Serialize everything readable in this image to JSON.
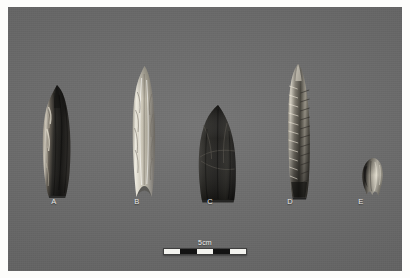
{
  "figure": {
    "background_color": "#6e6e6e",
    "border_color": "#fdfdfb",
    "caption_color": "#e8e8e6"
  },
  "specimens": [
    {
      "label": "A",
      "description": "dark mottled fluted projectile point, straight base",
      "color_dark": "#20201e",
      "color_mid": "#4a4843",
      "color_light": "#cfc9bc",
      "label_x": 54
    },
    {
      "label": "B",
      "description": "pale chalcedony fluted point with concave notched base",
      "color_dark": "#7d7a70",
      "color_mid": "#b8b4a6",
      "color_light": "#efece1",
      "label_x": 137
    },
    {
      "label": "C",
      "description": "broad dark lanceolate point, rounded tip",
      "color_dark": "#1b1a18",
      "color_mid": "#35332f",
      "color_light": "#5e5b54",
      "label_x": 210
    },
    {
      "label": "D",
      "description": "long narrow point with deeply serrated flaked edges",
      "color_dark": "#232220",
      "color_mid": "#5c5951",
      "color_light": "#d8d3c6",
      "label_x": 290
    },
    {
      "label": "E",
      "description": "small broken point fragment",
      "color_dark": "#2a2825",
      "color_mid": "#7a766c",
      "color_light": "#ddd8ca",
      "label_x": 361
    }
  ],
  "scale": {
    "text": "5cm",
    "segments": [
      "white",
      "black",
      "white",
      "black",
      "white"
    ]
  }
}
